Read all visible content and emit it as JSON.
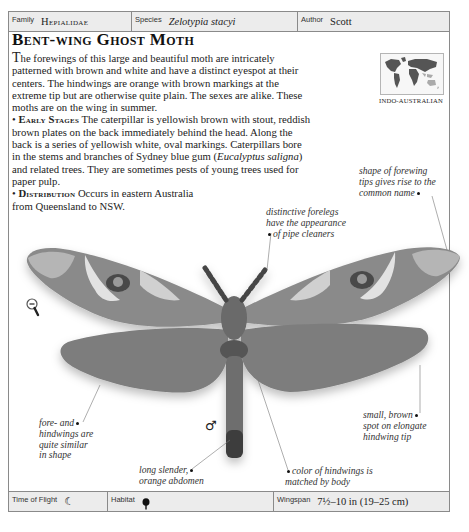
{
  "header": {
    "family_label": "Family",
    "family_value": "Hepialidae",
    "species_label": "Species",
    "species_value": "Zelotypia stacyi",
    "author_label": "Author",
    "author_value": "Scott"
  },
  "title": "Bent-wing Ghost Moth",
  "description": {
    "intro_dropcap": "T",
    "intro": "he forewings of this large and beautiful moth are intricately patterned with brown and white and have a distinct eyespot at their centers. The hindwings are orange with brown markings at the extreme tip but are otherwise quite plain. The sexes are alike. These moths are on the wing in summer.",
    "early_stages_heading": "Early Stages",
    "early_stages_text_1": " The caterpillar is yellowish brown with stout, reddish brown plates on the back immediately behind the head. Along the back is a series of yellowish white, oval markings. Caterpillars bore in the stems and branches of Sydney blue gum (",
    "early_stages_italic": "Eucalyptus saligna",
    "early_stages_text_2": ") and related trees. They are sometimes pests of young trees used for paper pulp.",
    "distribution_heading": "Distribution",
    "distribution_text": " Occurs in eastern Australia from Queensland to NSW."
  },
  "map": {
    "region_label": "INDO-AUSTRALIAN"
  },
  "annotations": {
    "forewing_tips": [
      "shape of forewing",
      "tips gives rise to the",
      "common name"
    ],
    "forelegs": [
      "distinctive forelegs",
      "have the appearance",
      "of pipe cleaners"
    ],
    "fore_hindwings": [
      "fore- and",
      "hindwings are",
      "quite similar",
      "in shape"
    ],
    "abdomen": [
      "long slender,",
      "orange abdomen"
    ],
    "hindwing_color": [
      "color of hindwings is",
      "matched by body"
    ],
    "hindwing_tip": [
      "small, brown",
      "spot on elongate",
      "hindwing tip"
    ]
  },
  "symbols": {
    "sex": "♂",
    "zoom_icon": "magnifier-minus-icon"
  },
  "footer": {
    "time_label": "Time of Flight",
    "time_icon": "☾",
    "habitat_label": "Habitat",
    "habitat_icon": "tree-icon",
    "wingspan_label": "Wingspan",
    "wingspan_value": "7½–10 in (19–25 cm)"
  },
  "colors": {
    "border": "#8a8a8a",
    "bar_bg": "#ececec",
    "text": "#222222"
  }
}
